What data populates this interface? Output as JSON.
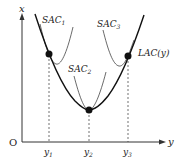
{
  "diagram": {
    "type": "cost-curves",
    "axes": {
      "vertical_label": "x",
      "horizontal_label": "y",
      "origin_label": "O"
    },
    "curves": {
      "long_run": {
        "label": "LAC(y)"
      },
      "short_run": [
        {
          "label": "SAC",
          "subscript": "1"
        },
        {
          "label": "SAC",
          "subscript": "2"
        },
        {
          "label": "SAC",
          "subscript": "3"
        }
      ]
    },
    "tick_labels": [
      {
        "label": "y",
        "subscript": "1"
      },
      {
        "label": "y",
        "subscript": "2"
      },
      {
        "label": "y",
        "subscript": "3"
      }
    ],
    "tangency_points": 3,
    "colors": {
      "ink": "#222222",
      "background": "#ffffff"
    }
  }
}
